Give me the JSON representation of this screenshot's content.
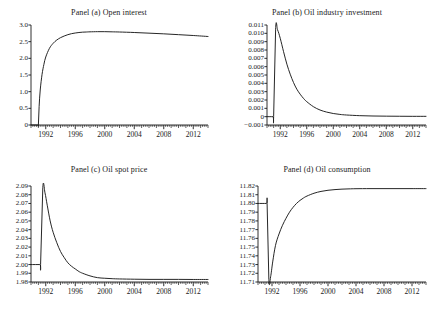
{
  "figure": {
    "background": "#ffffff",
    "line_color": "#1a1a1a",
    "axis_color": "#1a1a1a",
    "width": 436,
    "height": 314
  },
  "chart_data": [
    {
      "type": "line",
      "title": "Panel (a) Open interest",
      "xlabel": "",
      "ylabel": "",
      "grid": false,
      "legend": null,
      "xlim": [
        1990.0,
        2014.0
      ],
      "ylim": [
        0,
        3.0
      ],
      "xticks": [
        1992,
        1996,
        2000,
        2004,
        2008,
        2012
      ],
      "xtick_labels": [
        "1992",
        "1996",
        "2000",
        "2004",
        "2008",
        "2012"
      ],
      "yticks": [
        0,
        0.5,
        1.0,
        1.5,
        2.0,
        2.5,
        3.0
      ],
      "ytick_labels": [
        "0",
        "0.5",
        "1.0",
        "1.5",
        "2.0",
        "2.5",
        "3.0"
      ],
      "series": [
        {
          "name": "open interest",
          "x": [
            1990.0,
            1990.9,
            1991.0,
            1991.1,
            1991.25,
            1991.5,
            1991.75,
            1992.0,
            1992.5,
            1993.0,
            1993.5,
            1994.0,
            1994.5,
            1995.0,
            1995.5,
            1996.0,
            1996.5,
            1997.0,
            1997.5,
            1998.0,
            1999.0,
            2000.0,
            2001.0,
            2002.0,
            2004.0,
            2006.0,
            2008.0,
            2010.0,
            2012.0,
            2014.0
          ],
          "y": [
            0.0,
            0.0,
            0.0,
            0.55,
            1.05,
            1.52,
            1.82,
            2.04,
            2.3,
            2.45,
            2.55,
            2.62,
            2.67,
            2.71,
            2.74,
            2.76,
            2.775,
            2.785,
            2.79,
            2.795,
            2.8,
            2.8,
            2.795,
            2.79,
            2.775,
            2.755,
            2.735,
            2.71,
            2.685,
            2.655
          ]
        }
      ]
    },
    {
      "type": "line",
      "title": "Panel (b) Oil industry investment",
      "xlabel": "",
      "ylabel": "",
      "grid": false,
      "legend": null,
      "xlim": [
        1990.0,
        2014.0
      ],
      "ylim": [
        -0.001,
        0.011
      ],
      "xticks": [
        1992,
        1996,
        2000,
        2004,
        2008,
        2012
      ],
      "xtick_labels": [
        "1992",
        "1996",
        "2000",
        "2004",
        "2008",
        "2012"
      ],
      "yticks": [
        -0.001,
        0,
        0.001,
        0.002,
        0.003,
        0.004,
        0.005,
        0.006,
        0.007,
        0.008,
        0.009,
        0.01,
        0.011
      ],
      "ytick_labels": [
        "−0.001",
        "0",
        "0.001",
        "0.002",
        "0.003",
        "0.004",
        "0.005",
        "0.006",
        "0.007",
        "0.008",
        "0.009",
        "0.010",
        "0.011"
      ],
      "series": [
        {
          "name": "oil industry investment",
          "x": [
            1990.0,
            1990.9,
            1991.0,
            1991.3,
            1991.6,
            1992.0,
            1992.5,
            1993.0,
            1993.5,
            1994.0,
            1994.5,
            1995.0,
            1995.5,
            1996.0,
            1997.0,
            1998.0,
            1999.0,
            2000.0,
            2001.0,
            2002.0,
            2004.0,
            2006.0,
            2008.0,
            2010.0,
            2012.0,
            2014.0
          ],
          "y": [
            0.0,
            0.0,
            0.0,
            0.0105,
            0.0104,
            0.0094,
            0.0078,
            0.0063,
            0.0051,
            0.0041,
            0.0033,
            0.0027,
            0.0022,
            0.0018,
            0.0012,
            0.0008,
            0.00055,
            0.00038,
            0.00027,
            0.0002,
            0.00012,
            8e-05,
            6e-05,
            5e-05,
            4e-05,
            4e-05
          ]
        }
      ]
    },
    {
      "type": "line",
      "title": "Panel (c) Oil spot price",
      "xlabel": "",
      "ylabel": "",
      "grid": false,
      "legend": null,
      "xlim": [
        1990.0,
        2014.0
      ],
      "ylim": [
        1.98,
        2.09
      ],
      "xticks": [
        1992,
        1996,
        2000,
        2004,
        2008,
        2012
      ],
      "xtick_labels": [
        "1992",
        "1996",
        "2000",
        "2004",
        "2008",
        "2012"
      ],
      "yticks": [
        1.98,
        1.99,
        2.0,
        2.01,
        2.02,
        2.03,
        2.04,
        2.05,
        2.06,
        2.07,
        2.08,
        2.09
      ],
      "ytick_labels": [
        "1.98",
        "1.99",
        "2.00",
        "2.01",
        "2.02",
        "2.03",
        "2.04",
        "2.05",
        "2.06",
        "2.07",
        "2.08",
        "2.09"
      ],
      "series": [
        {
          "name": "oil spot price",
          "x": [
            1990.0,
            1991.2,
            1991.3,
            1991.6,
            1991.9,
            1992.2,
            1992.6,
            1993.0,
            1993.5,
            1994.0,
            1994.5,
            1995.0,
            1995.5,
            1996.0,
            1996.5,
            1997.0,
            1998.0,
            1999.0,
            2000.0,
            2001.0,
            2002.0,
            2004.0,
            2006.0,
            2008.0,
            2010.0,
            2012.0,
            2014.0
          ],
          "y": [
            2.0,
            2.0,
            2.0,
            2.088,
            2.082,
            2.068,
            2.05,
            2.037,
            2.025,
            2.015,
            2.008,
            2.002,
            1.998,
            1.995,
            1.992,
            1.99,
            1.987,
            1.985,
            1.9843,
            1.9838,
            1.9835,
            1.9832,
            1.983,
            1.983,
            1.983,
            1.9829,
            1.9829
          ]
        }
      ]
    },
    {
      "type": "line",
      "title": "Panel (d) Oil consumption",
      "xlabel": "",
      "ylabel": "",
      "grid": false,
      "legend": null,
      "xlim": [
        1990.0,
        2014.0
      ],
      "ylim": [
        11.71,
        11.82
      ],
      "xticks": [
        1992,
        1996,
        2000,
        2004,
        2008,
        2012
      ],
      "xtick_labels": [
        "1992",
        "1996",
        "2000",
        "2004",
        "2008",
        "2012"
      ],
      "yticks": [
        11.71,
        11.72,
        11.73,
        11.74,
        11.75,
        11.76,
        11.77,
        11.78,
        11.79,
        11.8,
        11.81,
        11.82
      ],
      "ytick_labels": [
        "11.71",
        "11.72",
        "11.73",
        "11.74",
        "11.75",
        "11.76",
        "11.77",
        "11.78",
        "11.79",
        "11.80",
        "11.81",
        "11.82"
      ],
      "series": [
        {
          "name": "oil consumption",
          "x": [
            1990.0,
            1991.2,
            1991.3,
            1991.55,
            1991.8,
            1992.1,
            1992.5,
            1993.0,
            1993.5,
            1994.0,
            1994.5,
            1995.0,
            1995.5,
            1996.0,
            1996.5,
            1997.0,
            1998.0,
            1999.0,
            2000.0,
            2001.0,
            2002.0,
            2003.0,
            2004.0,
            2006.0,
            2008.0,
            2010.0,
            2012.0,
            2014.0
          ],
          "y": [
            11.8,
            11.8,
            11.8,
            11.713,
            11.716,
            11.733,
            11.752,
            11.765,
            11.775,
            11.783,
            11.79,
            11.7955,
            11.8,
            11.8035,
            11.8063,
            11.8085,
            11.8117,
            11.8138,
            11.8151,
            11.8159,
            11.8164,
            11.8167,
            11.8169,
            11.817,
            11.817,
            11.817,
            11.817,
            11.817
          ]
        }
      ]
    }
  ],
  "panels": [
    {
      "id": "a",
      "title": "Panel (a) Open interest"
    },
    {
      "id": "b",
      "title": "Panel (b) Oil industry investment"
    },
    {
      "id": "c",
      "title": "Panel (c) Oil spot price"
    },
    {
      "id": "d",
      "title": "Panel (d) Oil consumption"
    }
  ]
}
